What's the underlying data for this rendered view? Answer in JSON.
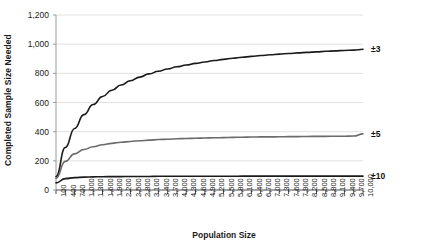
{
  "chart_data": {
    "type": "line",
    "title": "",
    "xlabel": "Population Size",
    "ylabel": "Completed Sample Size Needed",
    "xlim": [
      100,
      10000
    ],
    "ylim": [
      0,
      1200
    ],
    "grid": true,
    "legend_position": "right-inline",
    "x": [
      100,
      400,
      700,
      1000,
      1300,
      1600,
      1900,
      2200,
      2500,
      2800,
      3100,
      3400,
      3700,
      4000,
      4300,
      4600,
      4900,
      5200,
      5500,
      5800,
      6100,
      6400,
      6700,
      7000,
      7300,
      7600,
      7900,
      8200,
      8500,
      8800,
      9100,
      9400,
      9700,
      10000
    ],
    "xtick_labels": [
      "100",
      "400",
      "700",
      "1,000",
      "1,300",
      "1,600",
      "1,900",
      "2,200",
      "2,500",
      "2,800",
      "3,100",
      "3,400",
      "3,700",
      "4,000",
      "4,300",
      "4,600",
      "4,900",
      "5,200",
      "5,500",
      "5,800",
      "6,100",
      "6,400",
      "6,700",
      "7,000",
      "7,300",
      "7,600",
      "7,900",
      "8,200",
      "8,500",
      "8,800",
      "9,100",
      "9,400",
      "9,700",
      "10,000"
    ],
    "ytick_labels": [
      "0",
      "200",
      "400",
      "600",
      "800",
      "1,000",
      "1,200"
    ],
    "ytick_values": [
      0,
      200,
      400,
      600,
      800,
      1000,
      1200
    ],
    "series": [
      {
        "name": "±3",
        "color": "#1a1a1a",
        "width": 1.6,
        "values": [
          92,
          291,
          422,
          517,
          586,
          641,
          684,
          720,
          749,
          774,
          796,
          814,
          830,
          845,
          857,
          868,
          878,
          888,
          896,
          903,
          910,
          916,
          922,
          927,
          932,
          936,
          940,
          944,
          947,
          951,
          954,
          957,
          959,
          965
        ]
      },
      {
        "name": "±5",
        "color": "#6b6b6b",
        "width": 1.6,
        "values": [
          80,
          196,
          248,
          278,
          297,
          310,
          320,
          327,
          333,
          338,
          342,
          346,
          348,
          351,
          353,
          355,
          357,
          358,
          359,
          361,
          362,
          363,
          364,
          364,
          365,
          366,
          366,
          367,
          368,
          368,
          369,
          369,
          370,
          385
        ]
      },
      {
        "name": "±10",
        "color": "#1a1a1a",
        "width": 1.6,
        "values": [
          49,
          78,
          85,
          88,
          90,
          91,
          92,
          92,
          93,
          93,
          93,
          94,
          94,
          94,
          94,
          94,
          94,
          94,
          94,
          94,
          95,
          95,
          95,
          95,
          95,
          95,
          95,
          95,
          95,
          95,
          95,
          95,
          95,
          95
        ]
      }
    ],
    "colors": {
      "grid": "#e2e2e2",
      "axis": "#9a9a9a",
      "text": "#1a1a1a",
      "background": "#ffffff"
    }
  }
}
